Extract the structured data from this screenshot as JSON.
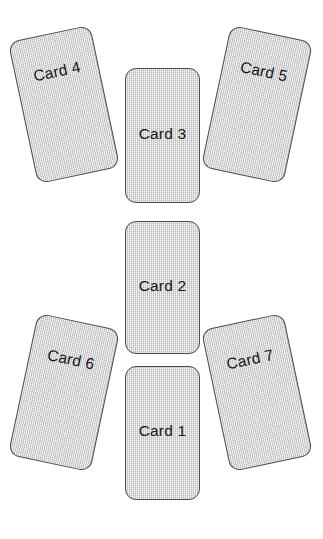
{
  "page": {
    "background_color": "#ffffff",
    "width": 323,
    "height": 539,
    "clipped_header_text": ""
  },
  "spread": {
    "name": "seven-card-spread",
    "card_style": {
      "fill_color": "#cfcfcf",
      "border_color": "#4a4a4a",
      "text_color": "#17171a",
      "corner_radius": "11px",
      "texture": "fine-woven-hatch"
    },
    "cards": [
      {
        "id": "card-4",
        "label": "Card 4",
        "position": "top-left",
        "rotation_deg": -12,
        "left": 22,
        "top": 32,
        "width": 84,
        "height": 145,
        "label_offset": "high"
      },
      {
        "id": "card-3",
        "label": "Card 3",
        "position": "top-center",
        "rotation_deg": 0,
        "left": 125,
        "top": 68,
        "width": 75,
        "height": 135,
        "label_offset": "mid"
      },
      {
        "id": "card-5",
        "label": "Card 5",
        "position": "top-right",
        "rotation_deg": 12,
        "left": 215,
        "top": 32,
        "width": 84,
        "height": 145,
        "label_offset": "high"
      },
      {
        "id": "card-2",
        "label": "Card 2",
        "position": "middle-center",
        "rotation_deg": 0,
        "left": 125,
        "top": 221,
        "width": 75,
        "height": 133,
        "label_offset": "mid"
      },
      {
        "id": "card-6",
        "label": "Card 6",
        "position": "bottom-left",
        "rotation_deg": 12,
        "left": 22,
        "top": 320,
        "width": 84,
        "height": 145,
        "label_offset": "high"
      },
      {
        "id": "card-1",
        "label": "Card 1",
        "position": "bottom-center",
        "rotation_deg": 0,
        "left": 125,
        "top": 366,
        "width": 75,
        "height": 134,
        "label_offset": "mid"
      },
      {
        "id": "card-7",
        "label": "Card 7",
        "position": "bottom-right",
        "rotation_deg": -12,
        "left": 215,
        "top": 320,
        "width": 84,
        "height": 145,
        "label_offset": "high"
      }
    ]
  }
}
